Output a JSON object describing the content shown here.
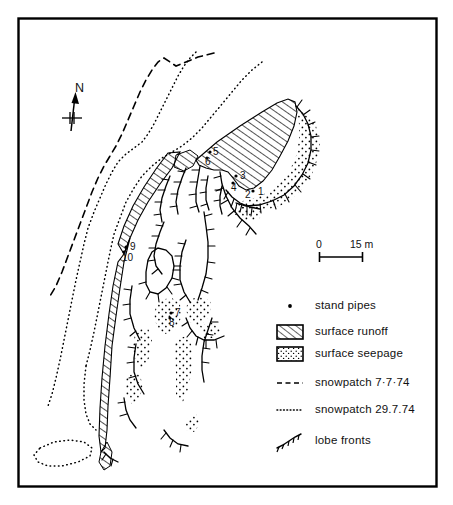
{
  "figure": {
    "type": "geomorphological map",
    "frame": {
      "stroke": "#000000",
      "fill": "#ffffff"
    }
  },
  "north_arrow": {
    "label": "N"
  },
  "scale_bar": {
    "start_label": "0",
    "end_label": "15 m"
  },
  "stand_pipes": [
    {
      "id": "1",
      "label": "1",
      "x": 258,
      "y": 193,
      "dot_x": 253,
      "dot_y": 191
    },
    {
      "id": "2",
      "label": "2",
      "x": 245,
      "y": 195,
      "dot_x": 252,
      "dot_y": 193
    },
    {
      "id": "3",
      "label": "3",
      "x": 241,
      "y": 177,
      "dot_x": 236,
      "dot_y": 176
    },
    {
      "id": "4",
      "label": "4",
      "x": 233,
      "y": 188,
      "dot_x": 233,
      "dot_y": 183
    },
    {
      "id": "5",
      "label": "5",
      "x": 214,
      "y": 153,
      "dot_x": 210,
      "dot_y": 152
    },
    {
      "id": "6",
      "label": "6",
      "x": 206,
      "y": 162,
      "dot_x": 207,
      "dot_y": 157
    },
    {
      "id": "7",
      "label": "7",
      "x": 176,
      "y": 314,
      "dot_x": 171,
      "dot_y": 313
    },
    {
      "id": "8",
      "label": "8",
      "x": 170,
      "y": 324,
      "dot_x": 170,
      "dot_y": 318
    },
    {
      "id": "9",
      "label": "9",
      "x": 131,
      "y": 248,
      "dot_x": 126,
      "dot_y": 247
    },
    {
      "id": "10",
      "label": "10",
      "x": 124,
      "y": 259,
      "dot_x": 122,
      "dot_y": 255
    }
  ],
  "legend": {
    "items": [
      {
        "key": "stand-pipes",
        "symbol": "dot",
        "label": "stand pipes"
      },
      {
        "key": "surface-runoff",
        "symbol": "hatch",
        "label": "surface runoff"
      },
      {
        "key": "surface-seepage",
        "symbol": "stipple",
        "label": "surface seepage"
      },
      {
        "key": "snowpatch-7-7-74",
        "symbol": "dashed",
        "label": "snowpatch 7·7·74"
      },
      {
        "key": "snowpatch-29-7-74",
        "symbol": "dotted",
        "label": "snowpatch 29.7.74"
      },
      {
        "key": "lobe-fronts",
        "symbol": "barbed",
        "label": "lobe fronts"
      }
    ]
  }
}
